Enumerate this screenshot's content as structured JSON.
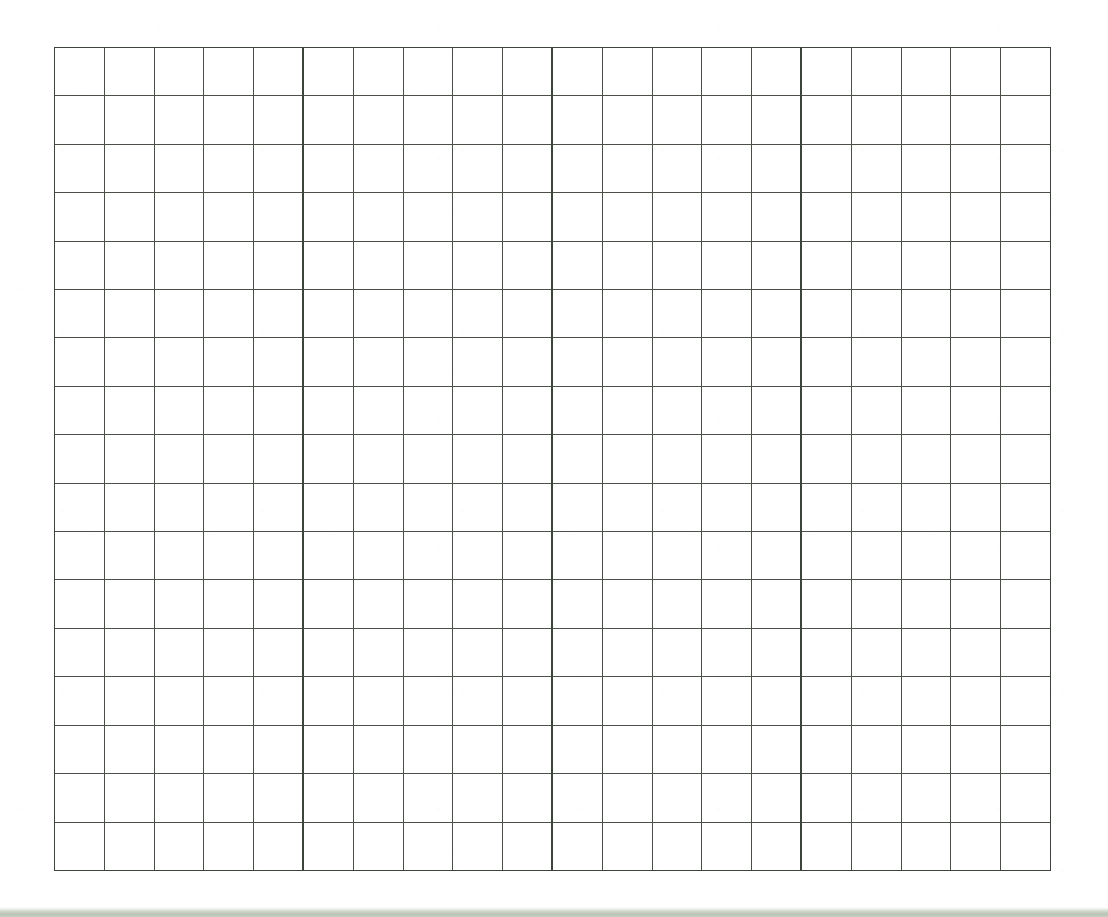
{
  "document": {
    "kind": "blank-grid-worksheet",
    "title": "Blank Grid Worksheet",
    "description": "Scanned blank grid / graph paper sheet with no printed text, labels or data.",
    "page_background_color": "#ffffff",
    "visible_text": ""
  },
  "grid": {
    "columns": 20,
    "rows": 17,
    "total_cells": 340,
    "cell_width_px": 49.85,
    "cell_height_px": 48.47,
    "left_px": 54,
    "top_px": 47,
    "width_px": 997,
    "height_px": 824,
    "line_color": "#4a5048",
    "major_line_color": "#3d443c",
    "minor_line_width_px": 1,
    "major_line_width_px": 2,
    "major_vertical_every": 5,
    "major_vertical_columns": [
      5,
      10,
      15
    ],
    "major_horizontal_every": 0,
    "cell_fill_color": "#ffffff",
    "filled_cells": [],
    "cell_labels": []
  },
  "margins": {
    "left_px": 54,
    "top_px": 47,
    "right_px": 57,
    "bottom_px": 46
  },
  "scan_artifacts": {
    "bottom_band_color": "#b9c4b5",
    "bottom_band_highlight": "#e7ebe4",
    "bottom_band_height_px": 10,
    "bottom_band_label": "scanner edge band"
  },
  "chart_data": {
    "type": "table",
    "title": "",
    "xlabel": "",
    "ylabel": "",
    "columns": 20,
    "rows": 17,
    "column_headers": [],
    "row_headers": [],
    "values": [],
    "grid": true,
    "legend": "none"
  }
}
